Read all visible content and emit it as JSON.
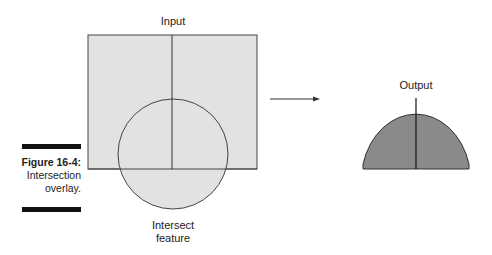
{
  "diagram": {
    "input_label": "Input",
    "intersect_label_line1": "Intersect",
    "intersect_label_line2": "feature",
    "output_label": "Output",
    "colors": {
      "input_fill": "#e2e2e2",
      "output_fill": "#8a8a8a",
      "stroke": "#333333"
    }
  },
  "caption": {
    "figure_number": "Figure 16-4:",
    "line1": "Intersection",
    "line2": "overlay."
  }
}
